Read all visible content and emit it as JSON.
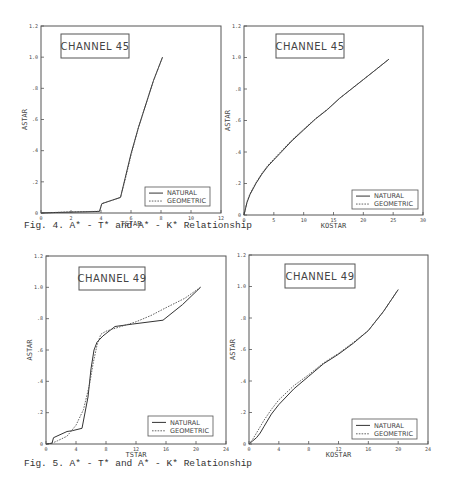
{
  "figures": [
    {
      "caption": "Fig. 4. A* - T* and A* - K* Relationship"
    },
    {
      "caption": "Fig. 5. A* - T* and A* - K* Relationship"
    }
  ],
  "legend": {
    "natural": "NATURAL",
    "geometric": "GEOMETRIC"
  },
  "chart_data": [
    {
      "id": "ch45-tstar",
      "type": "line",
      "title": "CHANNEL 45",
      "xlabel": "TSTAR",
      "ylabel": "ASTAR",
      "xlim": [
        0,
        12
      ],
      "ylim": [
        0,
        1.2
      ],
      "xticks": [
        0,
        2,
        4,
        6,
        8,
        10,
        12
      ],
      "xticklabels": [
        "0",
        "2",
        "4",
        "6",
        "8",
        "10",
        "12"
      ],
      "yticks": [
        0,
        0.2,
        0.4,
        0.6,
        0.8,
        1.0,
        1.2
      ],
      "yticklabels": [
        "0",
        ".2",
        ".4",
        ".6",
        ".8",
        "1.0",
        "1.2"
      ],
      "grid": false,
      "legend_position": "lower right",
      "frame": {
        "left": 41,
        "right": 221,
        "top": 26,
        "bottom": 213
      },
      "title_box": {
        "x": 61,
        "y": 34,
        "w": 68,
        "h": 24
      },
      "legend_box": {
        "x": 145,
        "y": 187,
        "w": 65,
        "h": 19
      },
      "series": [
        {
          "name": "NATURAL",
          "style": "solid",
          "x": [
            0,
            1,
            2,
            3,
            3.9,
            4.05,
            5.3,
            5.6,
            6.0,
            6.5,
            7.0,
            7.5,
            8.1
          ],
          "y": [
            0,
            0.003,
            0.006,
            0.008,
            0.01,
            0.06,
            0.1,
            0.22,
            0.38,
            0.55,
            0.7,
            0.85,
            1.0
          ]
        },
        {
          "name": "GEOMETRIC",
          "style": "dashed",
          "x": [
            0,
            1,
            2,
            3,
            3.9,
            4.05,
            5.3,
            5.6,
            6.0,
            6.5,
            7.0,
            7.5,
            8.1
          ],
          "y": [
            0,
            0.004,
            0.007,
            0.009,
            0.011,
            0.06,
            0.1,
            0.21,
            0.37,
            0.55,
            0.7,
            0.85,
            1.0
          ]
        }
      ]
    },
    {
      "id": "ch45-kostar",
      "type": "line",
      "title": "CHANNEL 45",
      "xlabel": "KOSTAR",
      "ylabel": "ASTAR",
      "xlim": [
        0,
        30
      ],
      "ylim": [
        0,
        1.2
      ],
      "xticks": [
        0,
        5,
        10,
        15,
        20,
        25,
        30
      ],
      "xticklabels": [
        "0",
        "5",
        "10",
        "15",
        "20",
        "25",
        "30"
      ],
      "yticks": [
        0,
        0.2,
        0.4,
        0.6,
        0.8,
        1.0,
        1.2
      ],
      "yticklabels": [
        "0",
        ".2",
        ".4",
        ".6",
        ".8",
        "1.0",
        "1.2"
      ],
      "grid": false,
      "legend_position": "lower right",
      "frame": {
        "left": 244,
        "right": 423,
        "top": 26,
        "bottom": 215
      },
      "title_box": {
        "x": 276,
        "y": 34,
        "w": 68,
        "h": 24
      },
      "legend_box": {
        "x": 352,
        "y": 190,
        "w": 66,
        "h": 19
      },
      "series": [
        {
          "name": "NATURAL",
          "style": "solid",
          "x": [
            0,
            0.5,
            1,
            2,
            3,
            4,
            5,
            6,
            8,
            10,
            12,
            14,
            16,
            18,
            20,
            22,
            24.3
          ],
          "y": [
            0,
            0.08,
            0.13,
            0.2,
            0.26,
            0.31,
            0.35,
            0.39,
            0.47,
            0.54,
            0.61,
            0.67,
            0.74,
            0.8,
            0.86,
            0.92,
            0.99
          ]
        },
        {
          "name": "GEOMETRIC",
          "style": "dashed",
          "x": [
            0,
            0.5,
            1,
            2,
            3,
            4,
            5,
            6,
            8,
            10,
            12,
            14,
            16,
            18,
            20,
            22,
            24.3
          ],
          "y": [
            0,
            0.085,
            0.135,
            0.205,
            0.265,
            0.315,
            0.355,
            0.395,
            0.475,
            0.545,
            0.612,
            0.672,
            0.74,
            0.8,
            0.86,
            0.92,
            0.99
          ]
        }
      ]
    },
    {
      "id": "ch49-tstar",
      "type": "line",
      "title": "CHANNEL 49",
      "xlabel": "TSTAR",
      "ylabel": "ASTAR",
      "xlim": [
        0,
        24
      ],
      "ylim": [
        0,
        1.2
      ],
      "xticks": [
        0,
        4,
        8,
        12,
        16,
        20,
        24
      ],
      "xticklabels": [
        "0",
        "4",
        "8",
        "12",
        "16",
        "20",
        "24"
      ],
      "yticks": [
        0,
        0.2,
        0.4,
        0.6,
        0.8,
        1.0,
        1.2
      ],
      "yticklabels": [
        "0",
        ".2",
        ".4",
        ".6",
        ".8",
        "1.0",
        "1.2"
      ],
      "grid": false,
      "legend_position": "lower right",
      "frame": {
        "left": 46,
        "right": 226,
        "top": 256,
        "bottom": 444
      },
      "title_box": {
        "x": 79,
        "y": 267,
        "w": 66,
        "h": 23
      },
      "legend_box": {
        "x": 148,
        "y": 416,
        "w": 65,
        "h": 20
      },
      "series": [
        {
          "name": "NATURAL",
          "style": "solid",
          "x": [
            0,
            0.8,
            1.0,
            2.8,
            3.5,
            4.8,
            5.6,
            6.0,
            6.4,
            6.8,
            7.6,
            9.2,
            11.5,
            15.6,
            18.2,
            20.6
          ],
          "y": [
            0,
            0.005,
            0.04,
            0.08,
            0.085,
            0.1,
            0.3,
            0.48,
            0.6,
            0.65,
            0.69,
            0.75,
            0.765,
            0.79,
            0.89,
            1.0
          ]
        },
        {
          "name": "GEOMETRIC",
          "style": "dashed",
          "x": [
            0,
            0.8,
            1.5,
            2.8,
            4.0,
            5.0,
            5.8,
            6.3,
            6.8,
            7.3,
            8.0,
            10.0,
            12.0,
            14.0,
            16.0,
            18.5,
            20.6
          ],
          "y": [
            0,
            0.005,
            0.02,
            0.05,
            0.12,
            0.22,
            0.38,
            0.52,
            0.63,
            0.7,
            0.72,
            0.75,
            0.78,
            0.82,
            0.87,
            0.93,
            1.0
          ]
        }
      ]
    },
    {
      "id": "ch49-kostar",
      "type": "line",
      "title": "CHANNEL 49",
      "xlabel": "KOSTAR",
      "ylabel": "ASTAR",
      "xlim": [
        0,
        24
      ],
      "ylim": [
        0,
        1.2
      ],
      "xticks": [
        0,
        4,
        8,
        12,
        16,
        20,
        24
      ],
      "xticklabels": [
        "0",
        "4",
        "8",
        "12",
        "16",
        "20",
        "24"
      ],
      "yticks": [
        0,
        0.2,
        0.4,
        0.6,
        0.8,
        1.0,
        1.2
      ],
      "yticklabels": [
        "0",
        ".2",
        ".4",
        ".6",
        ".8",
        "1.0",
        "1.2"
      ],
      "grid": false,
      "legend_position": "lower right",
      "frame": {
        "left": 249,
        "right": 428,
        "top": 255,
        "bottom": 444
      },
      "title_box": {
        "x": 285,
        "y": 264,
        "w": 70,
        "h": 24
      },
      "legend_box": {
        "x": 352,
        "y": 419,
        "w": 65,
        "h": 20
      },
      "series": [
        {
          "name": "NATURAL",
          "style": "solid",
          "x": [
            0,
            0.5,
            1.0,
            1.5,
            2,
            3,
            4,
            6,
            8,
            10,
            12,
            14,
            16,
            17,
            18,
            20
          ],
          "y": [
            0,
            0.02,
            0.04,
            0.07,
            0.11,
            0.19,
            0.25,
            0.35,
            0.43,
            0.51,
            0.57,
            0.64,
            0.72,
            0.78,
            0.84,
            0.98
          ]
        },
        {
          "name": "GEOMETRIC",
          "style": "dashed",
          "x": [
            0,
            0.5,
            1.0,
            1.5,
            2,
            3,
            4,
            6,
            8,
            10,
            12,
            14,
            16,
            17,
            18,
            20
          ],
          "y": [
            0,
            0.03,
            0.07,
            0.11,
            0.15,
            0.22,
            0.28,
            0.37,
            0.44,
            0.515,
            0.575,
            0.645,
            0.72,
            0.78,
            0.84,
            0.98
          ]
        }
      ]
    }
  ]
}
